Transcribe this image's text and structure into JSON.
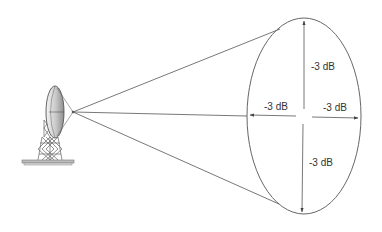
{
  "diagram": {
    "type": "antenna-beamwidth",
    "colors": {
      "line": "#555555",
      "text": "#333333",
      "dish_fill_light": "#f2f2f2",
      "dish_fill_dark": "#9a9a9a",
      "background": "#ffffff"
    },
    "labels": {
      "top": "-3 dB",
      "bottom": "-3 dB",
      "left": "-3 dB",
      "right": "-3 dB"
    },
    "antenna": {
      "component": "parabolic-dish",
      "mount": "lattice-tower",
      "base": "base-plate"
    },
    "beam": {
      "origin": [
        73,
        112
      ],
      "footprint_shape": "ellipse"
    }
  }
}
